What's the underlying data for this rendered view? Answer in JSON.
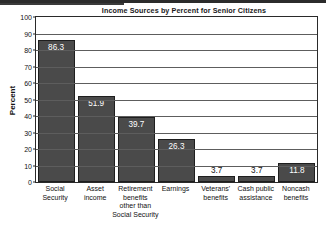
{
  "chart_data": {
    "type": "bar",
    "title": "Income Sources by Percent for Senior Citizens",
    "xlabel": "",
    "ylabel": "Percent",
    "ylim": [
      0,
      100
    ],
    "ytick_step": 10,
    "yticks": [
      100,
      90,
      80,
      70,
      60,
      50,
      40,
      30,
      20,
      10,
      0
    ],
    "grid": true,
    "legend": false,
    "categories": [
      "Social Security",
      "Asset income",
      "Retirement benefits other than Social Security",
      "Earnings",
      "Veterans' benefits",
      "Cash public assistance",
      "Noncash benefits"
    ],
    "category_lines": [
      [
        "Social",
        "Security"
      ],
      [
        "Asset",
        "income"
      ],
      [
        "Retirement",
        "benefits",
        "other than",
        "Social Security"
      ],
      [
        "Earnings"
      ],
      [
        "Veterans'",
        "benefits"
      ],
      [
        "Cash public",
        "assistance"
      ],
      [
        "Noncash",
        "benefits"
      ]
    ],
    "values": [
      86.3,
      51.9,
      39.7,
      26.3,
      3.7,
      3.7,
      11.8
    ],
    "value_labels": [
      "86.3",
      "51.9",
      "39.7",
      "26.3",
      "3.7",
      "3.7",
      "11.8"
    ],
    "label_placement": [
      "inside",
      "inside",
      "inside",
      "inside",
      "outside",
      "outside",
      "inside"
    ],
    "bar_color": "#4a4a4a",
    "bar_border_color": "#1e1e1e",
    "axis_color": "#2a2a2a",
    "grid_color": "#5d5d5d",
    "plot_background": "#ffffff"
  }
}
